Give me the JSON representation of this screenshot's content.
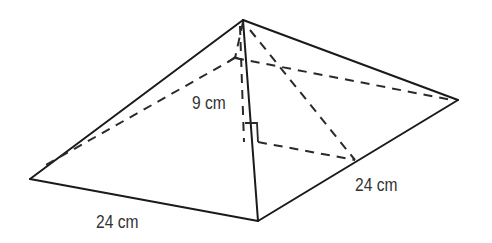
{
  "diagram": {
    "type": "square-based pyramid",
    "labels": {
      "height": "9 cm",
      "base_front_edge": "24 cm",
      "base_right_edge": "24 cm"
    },
    "markers": {
      "right_angle_at_base_center": true
    },
    "vertices": {
      "apex": [
        243,
        20
      ],
      "base_left": [
        30,
        179
      ],
      "base_front": [
        258,
        221
      ],
      "base_right": [
        458,
        100
      ],
      "base_back_hidden": [
        235,
        58
      ],
      "base_center": [
        245,
        142
      ],
      "right_edge_midpoint": [
        355,
        160
      ]
    },
    "colors": {
      "line": "#1a1a1a",
      "text": "#333333",
      "background": "#ffffff"
    }
  }
}
